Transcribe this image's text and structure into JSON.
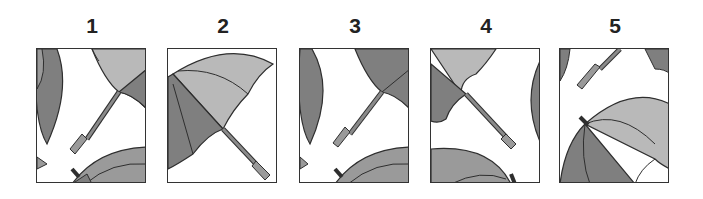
{
  "puzzle": {
    "description": "Which option is a cropped section of umbrella picture",
    "colors": {
      "dark": "#7f7f7f",
      "mid": "#9a9a9a",
      "light": "#b9b9b9",
      "stroke": "#2e2e2e"
    },
    "options": [
      {
        "label": "1"
      },
      {
        "label": "2"
      },
      {
        "label": "3"
      },
      {
        "label": "4"
      },
      {
        "label": "5"
      }
    ]
  }
}
